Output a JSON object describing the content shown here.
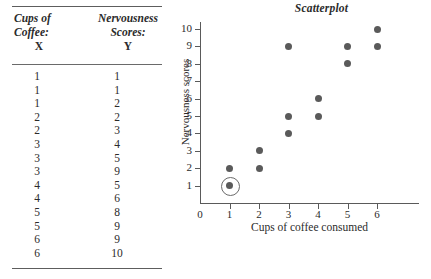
{
  "table": {
    "headers": {
      "x_title_line1": "Cups of",
      "x_title_line2": "Coffee:",
      "x_variable": "X",
      "y_title_line1": "Nervousness",
      "y_title_line2": "Scores:",
      "y_variable": "Y"
    },
    "rows": [
      {
        "x": "1",
        "y": "1"
      },
      {
        "x": "1",
        "y": "1"
      },
      {
        "x": "1",
        "y": "2"
      },
      {
        "x": "2",
        "y": "2"
      },
      {
        "x": "2",
        "y": "3"
      },
      {
        "x": "3",
        "y": "4"
      },
      {
        "x": "3",
        "y": "5"
      },
      {
        "x": "3",
        "y": "9"
      },
      {
        "x": "4",
        "y": "5"
      },
      {
        "x": "4",
        "y": "6"
      },
      {
        "x": "5",
        "y": "8"
      },
      {
        "x": "5",
        "y": "9"
      },
      {
        "x": "6",
        "y": "9"
      },
      {
        "x": "6",
        "y": "10"
      }
    ]
  },
  "chart_data": {
    "type": "scatter",
    "title": "Scatterplot",
    "xlabel": "Cups of coffee consumed",
    "ylabel": "Nervousness scores",
    "xlim": [
      0,
      6
    ],
    "ylim": [
      0,
      10
    ],
    "xticks": [
      "0",
      "1",
      "2",
      "3",
      "4",
      "5",
      "6"
    ],
    "yticks": [
      "1",
      "2",
      "3",
      "4",
      "5",
      "6",
      "7",
      "8",
      "9",
      "10"
    ],
    "grid": false,
    "legend": null,
    "point_color": "#5a5a5a",
    "highlight_color": "#6b6b6b",
    "points": [
      {
        "x": 1,
        "y": 1,
        "highlighted": true
      },
      {
        "x": 1,
        "y": 2,
        "highlighted": false
      },
      {
        "x": 2,
        "y": 2,
        "highlighted": false
      },
      {
        "x": 2,
        "y": 3,
        "highlighted": false
      },
      {
        "x": 3,
        "y": 4,
        "highlighted": false
      },
      {
        "x": 3,
        "y": 5,
        "highlighted": false
      },
      {
        "x": 3,
        "y": 9,
        "highlighted": false
      },
      {
        "x": 4,
        "y": 5,
        "highlighted": false
      },
      {
        "x": 4,
        "y": 6,
        "highlighted": false
      },
      {
        "x": 5,
        "y": 8,
        "highlighted": false
      },
      {
        "x": 5,
        "y": 9,
        "highlighted": false
      },
      {
        "x": 6,
        "y": 9,
        "highlighted": false
      },
      {
        "x": 6,
        "y": 10,
        "highlighted": false
      }
    ]
  }
}
